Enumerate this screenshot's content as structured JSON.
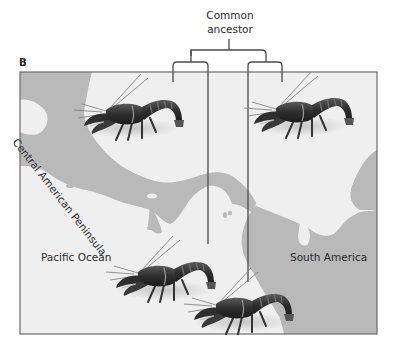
{
  "figure": {
    "panel_label": "B",
    "tree": {
      "root_label_line1": "Common",
      "root_label_line2": "ancestor"
    },
    "map_labels": {
      "peninsula": "Central American Peninsula",
      "ocean": "Pacific Ocean",
      "continent": "South America"
    },
    "organisms": [
      {
        "name": "crayfish",
        "position": "upper-left (Caribbean side)"
      },
      {
        "name": "crayfish",
        "position": "upper-right (Caribbean side)"
      },
      {
        "name": "crayfish",
        "position": "lower-left (Pacific side)"
      },
      {
        "name": "crayfish",
        "position": "lower-right (Pacific side)"
      }
    ],
    "colors": {
      "land": "#b9b9b9",
      "water": "#efefef",
      "frame": "#6b6b6b",
      "tree_line": "#4a4a4a",
      "crayfish_body": "#3a3a3a"
    }
  }
}
